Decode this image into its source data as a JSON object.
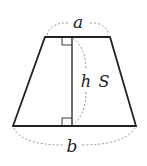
{
  "diagram": {
    "type": "trapezoid",
    "labels": {
      "top": "a",
      "bottom": "b",
      "height": "h",
      "area": "S"
    },
    "colors": {
      "stroke": "#222222",
      "dashed": "#888888",
      "background": "#ffffff"
    }
  }
}
